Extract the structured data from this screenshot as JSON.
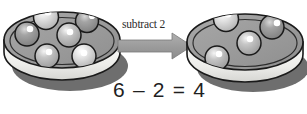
{
  "illustration": {
    "title": "subtraction-plate-illustration",
    "arrow_label": "subtract 2",
    "equation": "6 – 2 = 4",
    "equation_parts": {
      "minuend": "6",
      "operator": "–",
      "subtrahend": "2",
      "equals": "=",
      "difference": "4"
    },
    "background_color": "#ffffff",
    "colors": {
      "plate_top": "#9a9a9a",
      "plate_top_light": "#b4b4b4",
      "plate_rim": "#f2f2f0",
      "plate_rim_shade": "#d8d8d4",
      "plate_shadow": "#6e6e6e",
      "outline": "#1a1a1a",
      "ball_dark": "#8a8a8a",
      "ball_light": "#d2d2d2",
      "ball_mid": "#a8a8a8",
      "highlight": "#ffffff",
      "arrow_fill": "#9e9e9e",
      "arrow_stroke": "#7a7a7a",
      "text": "#1f1f1f"
    },
    "left_plate": {
      "name": "left-plate",
      "ball_count": 6,
      "balls": [
        {
          "id": "ball-l1",
          "cx": 46,
          "cy": 17,
          "r": 12.5,
          "shade": "light",
          "hx": 48,
          "hy": 12
        },
        {
          "id": "ball-l2",
          "cx": 87,
          "cy": 21,
          "r": 11.5,
          "shade": "dark",
          "hx": 92,
          "hy": 16
        },
        {
          "id": "ball-l3",
          "cx": 27,
          "cy": 34,
          "r": 12.0,
          "shade": "dark",
          "hx": 30,
          "hy": 29
        },
        {
          "id": "ball-l4",
          "cx": 69,
          "cy": 35,
          "r": 12.0,
          "shade": "mid",
          "hx": 70,
          "hy": 32
        },
        {
          "id": "ball-l5",
          "cx": 47,
          "cy": 56,
          "r": 12.0,
          "shade": "mid",
          "hx": 49,
          "hy": 52
        },
        {
          "id": "ball-l6",
          "cx": 84,
          "cy": 56,
          "r": 12.0,
          "shade": "light",
          "hx": 84,
          "hy": 53
        }
      ]
    },
    "right_plate": {
      "name": "right-plate",
      "ball_count": 4,
      "balls": [
        {
          "id": "ball-r1",
          "cx": 226,
          "cy": 19,
          "r": 12.5,
          "shade": "light",
          "hx": 228,
          "hy": 14
        },
        {
          "id": "ball-r2",
          "cx": 272,
          "cy": 27,
          "r": 12.0,
          "shade": "dark",
          "hx": 277,
          "hy": 23
        },
        {
          "id": "ball-r3",
          "cx": 249,
          "cy": 43,
          "r": 12.0,
          "shade": "mid",
          "hx": 250,
          "hy": 39
        },
        {
          "id": "ball-r4",
          "cx": 217,
          "cy": 58,
          "r": 12.0,
          "shade": "mid",
          "hx": 219,
          "hy": 54
        }
      ]
    },
    "arrow": {
      "name": "subtract-arrow",
      "direction": "right"
    }
  }
}
